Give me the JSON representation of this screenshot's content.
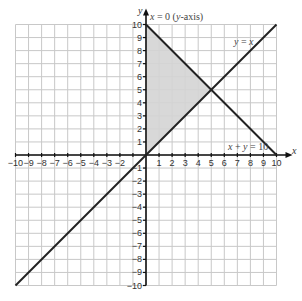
{
  "chart_data": {
    "type": "line",
    "title": "",
    "xlabel": "x",
    "ylabel": "y",
    "xlim": [
      -10,
      10
    ],
    "ylim": [
      -10,
      10
    ],
    "grid": true,
    "x_ticks": [
      -10,
      -9,
      -8,
      -7,
      -6,
      -5,
      -4,
      -3,
      -2,
      -1,
      1,
      2,
      3,
      4,
      5,
      6,
      7,
      8,
      9,
      10
    ],
    "y_ticks": [
      -10,
      -9,
      -8,
      -7,
      -6,
      -5,
      -4,
      -3,
      -2,
      -1,
      1,
      2,
      3,
      4,
      5,
      6,
      7,
      8,
      9,
      10
    ],
    "x_tick_labels": [
      "−10",
      "−9",
      "−8",
      "−7",
      "−6",
      "−5",
      "−4",
      "−3",
      "−2",
      "",
      "1",
      "2",
      "3",
      "4",
      "5",
      "6",
      "7",
      "8",
      "9",
      "10"
    ],
    "y_tick_labels": [
      "−10",
      "−9",
      "−8",
      "−7",
      "−6",
      "−5",
      "−4",
      "−3",
      "−2",
      "−1",
      "1",
      "2",
      "3",
      "4",
      "5",
      "6",
      "7",
      "8",
      "9",
      "10"
    ],
    "series": [
      {
        "name": "y = x",
        "points": [
          [
            -10,
            -10
          ],
          [
            10,
            10
          ]
        ],
        "color": "#222222"
      },
      {
        "name": "x + y = 10",
        "points": [
          [
            0,
            10
          ],
          [
            10,
            0
          ]
        ],
        "color": "#222222"
      },
      {
        "name": "x = 0 (y-axis)",
        "points": [
          [
            0,
            -10
          ],
          [
            0,
            10
          ]
        ],
        "color": "#222222"
      }
    ],
    "shaded_region": {
      "vertices": [
        [
          0,
          0
        ],
        [
          0,
          10
        ],
        [
          5,
          5
        ]
      ],
      "fill": "#d4d4d4",
      "description": "Region bounded by x = 0, y = x and x + y = 10"
    },
    "annotations": [
      {
        "text_var": "x",
        "text_rest": " = 0 (",
        "text_var2": "y",
        "text_rest2": "-axis)",
        "x": 0.1,
        "y": 10.2
      },
      {
        "text_var": "y",
        "text_rest": " = ",
        "text_var2": "x",
        "text_rest2": "",
        "x": 6.6,
        "y": 8.7
      },
      {
        "text_var": "x",
        "text_rest": " + ",
        "text_var2": "y",
        "text_rest2": " = 10",
        "x": 7.0,
        "y": 0.7
      }
    ]
  },
  "labels": {
    "x_axis": "x",
    "y_axis": "y",
    "ann_yaxis": {
      "a": "x",
      "b": " = 0 (",
      "c": "y",
      "d": "-axis)"
    },
    "ann_yeqx": {
      "a": "y",
      "b": " = ",
      "c": "x"
    },
    "ann_sum": {
      "a": "x",
      "b": " + ",
      "c": "y",
      "d": " = 10"
    }
  }
}
